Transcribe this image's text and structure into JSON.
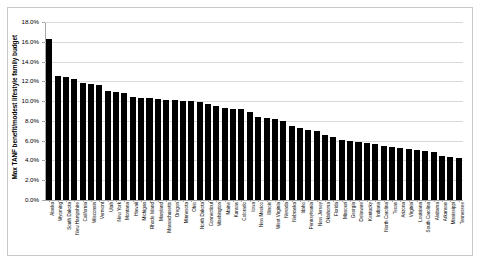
{
  "chart_data": {
    "type": "bar",
    "title": "",
    "xlabel": "",
    "ylabel": "Max TANF benefit/modest lifestyle family budget",
    "ylim": [
      0,
      18
    ],
    "ytick_labels": [
      "0.0%",
      "2.0%",
      "4.0%",
      "6.0%",
      "8.0%",
      "10.0%",
      "12.0%",
      "14.0%",
      "16.0%",
      "18.0%"
    ],
    "ytick_values": [
      0,
      2,
      4,
      6,
      8,
      10,
      12,
      14,
      16,
      18
    ],
    "grid": true,
    "legend": "none",
    "bar_color": "#000000",
    "categories": [
      "Alaska",
      "Wyoming",
      "South Dakota",
      "New Hampshire",
      "California",
      "Wisconsin",
      "Vermont",
      "Utah",
      "New York",
      "Montana",
      "Hawaii",
      "Michigan",
      "Rhode Island",
      "Maryland",
      "Massachusetts",
      "Oregon",
      "Minnesota",
      "Ohio",
      "North Dakota",
      "Connecticut",
      "Washington",
      "Maine",
      "Kansas",
      "Colorado",
      "Iowa",
      "New Mexico",
      "Illinois",
      "West Virginia",
      "Nevada",
      "Nebraska",
      "Idaho",
      "Pennsylvania",
      "New Jersey",
      "Oklahoma",
      "Florida",
      "Missouri",
      "Georgia",
      "Delaware",
      "Kentucky",
      "Indiana",
      "North Carolina",
      "Texas",
      "Arizona",
      "Virginia",
      "Louisiana",
      "South Carolina",
      "Alabama",
      "Arkansas",
      "Mississippi",
      "Tennessee"
    ],
    "values": [
      16.3,
      12.5,
      12.4,
      12.2,
      11.8,
      11.7,
      11.6,
      11.0,
      10.9,
      10.8,
      10.4,
      10.3,
      10.3,
      10.2,
      10.1,
      10.1,
      10.0,
      10.0,
      9.9,
      9.7,
      9.5,
      9.3,
      9.2,
      9.2,
      8.9,
      8.4,
      8.3,
      8.2,
      8.0,
      7.5,
      7.3,
      7.1,
      7.0,
      6.6,
      6.4,
      6.1,
      6.0,
      5.9,
      5.8,
      5.7,
      5.5,
      5.4,
      5.3,
      5.2,
      5.1,
      5.0,
      4.9,
      4.5,
      4.4,
      4.2
    ]
  }
}
